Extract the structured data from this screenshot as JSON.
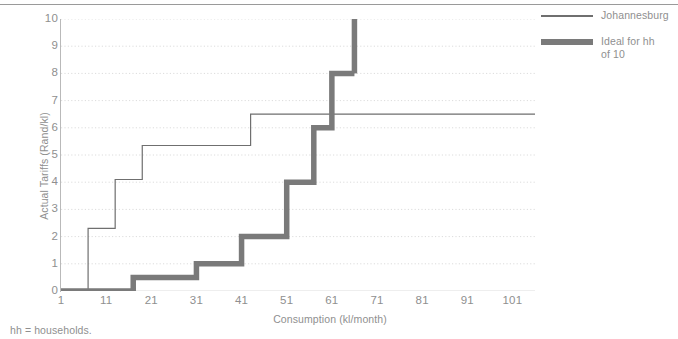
{
  "footnote": "hh = households.",
  "legend": {
    "position": "right",
    "items": [
      {
        "label": "Johannesburg",
        "style": "thin-line",
        "color": "#6f6f6f"
      },
      {
        "label": "Ideal for hh\nof 10",
        "label_line1": "Ideal for hh",
        "label_line2": "of 10",
        "style": "thick-line",
        "color": "#7a7a7a"
      }
    ]
  },
  "chart_data": {
    "type": "line",
    "title": "",
    "subtitle": "",
    "xlabel": "Consumption (kl/month)",
    "ylabel": "Actual Tariffs (Rand/kl)",
    "xlim": [
      1,
      106
    ],
    "ylim": [
      0,
      10
    ],
    "xticks": [
      1,
      11,
      21,
      31,
      41,
      51,
      61,
      71,
      81,
      91,
      101
    ],
    "yticks": [
      0,
      1,
      2,
      3,
      4,
      5,
      6,
      7,
      8,
      9,
      10
    ],
    "grid": "horizontal-dotted",
    "grid_color": "#dcdcdc",
    "step_style": "post",
    "series": [
      {
        "name": "Johannesburg",
        "color": "#6f6f6f",
        "width": 1.2,
        "x": [
          1,
          7,
          7,
          13,
          13,
          19,
          19,
          22,
          22,
          43,
          43,
          106
        ],
        "y": [
          0,
          0,
          2.3,
          2.3,
          4.1,
          4.1,
          5.35,
          5.35,
          5.35,
          5.35,
          6.5,
          6.5
        ],
        "steps": [
          {
            "from_x": 1,
            "to_x": 7,
            "value": 0
          },
          {
            "from_x": 7,
            "to_x": 13,
            "value": 2.3
          },
          {
            "from_x": 13,
            "to_x": 19,
            "value": 4.1
          },
          {
            "from_x": 19,
            "to_x": 43,
            "value": 5.35
          },
          {
            "from_x": 43,
            "to_x": 106,
            "value": 6.5
          }
        ]
      },
      {
        "name": "Ideal for hh of 10",
        "color": "#7a7a7a",
        "width": 5.5,
        "x": [
          1,
          17,
          17,
          31,
          31,
          41,
          41,
          51,
          51,
          57,
          57,
          61,
          61,
          66
        ],
        "y": [
          0,
          0,
          0.5,
          0.5,
          1,
          1,
          2,
          2,
          4,
          4,
          6,
          6,
          8,
          8
        ],
        "steps": [
          {
            "from_x": 1,
            "to_x": 17,
            "value": 0
          },
          {
            "from_x": 17,
            "to_x": 31,
            "value": 0.5
          },
          {
            "from_x": 31,
            "to_x": 41,
            "value": 1
          },
          {
            "from_x": 41,
            "to_x": 51,
            "value": 2
          },
          {
            "from_x": 51,
            "to_x": 57,
            "value": 4
          },
          {
            "from_x": 57,
            "to_x": 61,
            "value": 6
          },
          {
            "from_x": 61,
            "to_x": 66,
            "value": 8
          },
          {
            "from_x": 66,
            "to_x": 66,
            "value": 10
          }
        ]
      }
    ]
  }
}
